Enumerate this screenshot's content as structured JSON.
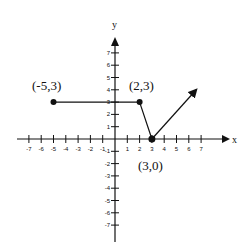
{
  "chart_data": {
    "type": "line",
    "title": "",
    "xlabel": "x",
    "ylabel": "y",
    "xlim": [
      -7,
      7
    ],
    "ylim": [
      -7,
      7
    ],
    "grid": false,
    "x_ticks": [
      -7,
      -6,
      -5,
      -4,
      -3,
      -2,
      -1,
      1,
      2,
      3,
      4,
      5,
      6,
      7
    ],
    "y_ticks": [
      -7,
      -6,
      -5,
      -4,
      -3,
      -2,
      -1,
      1,
      2,
      3,
      4,
      5,
      6,
      7
    ],
    "series": [
      {
        "name": "piecewise",
        "points": [
          {
            "x": -5,
            "y": 3,
            "endpoint": "closed"
          },
          {
            "x": 2,
            "y": 3,
            "endpoint": "closed"
          },
          {
            "x": 3,
            "y": 0,
            "endpoint": "closed"
          },
          {
            "x": 6.5,
            "y": 4,
            "endpoint": "arrow"
          }
        ]
      }
    ],
    "annotations": [
      {
        "text": "(-5,3)",
        "x": -5,
        "y": 3
      },
      {
        "text": "(2,3)",
        "x": 2,
        "y": 3
      },
      {
        "text": "(3,0)",
        "x": 3,
        "y": 0
      }
    ]
  },
  "labels": {
    "x_axis": "x",
    "y_axis": "y",
    "point_a": "(-5,3)",
    "point_b": "(2,3)",
    "point_c": "(3,0)"
  }
}
